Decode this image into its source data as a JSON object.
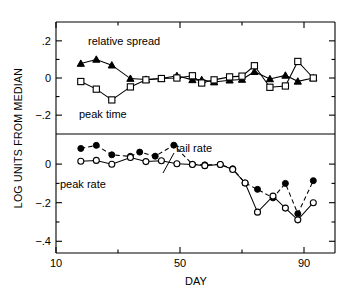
{
  "figure": {
    "title": "",
    "xaxis_title": "DAY",
    "yaxis_title": "LOG UNITS FROM MEDIAN",
    "x_ticklabels": [
      "10",
      "50",
      "90"
    ],
    "upper_ticklabels": [
      ".2",
      "0",
      "−.2"
    ],
    "lower_ticklabels": [
      "0",
      "−.2",
      "−.4"
    ],
    "labels": {
      "relative_spread": "relative spread",
      "peak_time": "peak time",
      "tail_rate": "tail rate",
      "peak_rate": "peak rate"
    }
  },
  "chart_data": [
    {
      "type": "line",
      "panel": "upper",
      "title": "",
      "xlabel": "DAY",
      "ylabel": "LOG UNITS FROM MEDIAN",
      "xlim": [
        10,
        100
      ],
      "ylim": [
        -0.28,
        0.28
      ],
      "xticks": [
        10,
        50,
        90
      ],
      "xticks_minor": [
        30,
        70
      ],
      "yticks": [
        0.2,
        0.0,
        -0.2
      ],
      "yticks_minor": [
        0.1,
        -0.1
      ],
      "grid": false,
      "legend": "inline-annotation",
      "series": [
        {
          "name": "relative spread",
          "marker": "filled-triangle",
          "linestyle": "solid",
          "points": [
            [
              18,
              0.078
            ],
            [
              23,
              0.1
            ],
            [
              28,
              0.069
            ],
            [
              34,
              -0.003
            ],
            [
              39,
              -0.008
            ],
            [
              44,
              -0.003
            ],
            [
              49,
              0.012
            ],
            [
              54,
              -0.01
            ],
            [
              57,
              -0.01
            ],
            [
              61,
              -0.022
            ],
            [
              66,
              -0.012
            ],
            [
              70,
              -0.008
            ],
            [
              74,
              0.034
            ],
            [
              79,
              -0.005
            ],
            [
              84,
              0.014
            ],
            [
              88,
              -0.018
            ],
            [
              93,
              0.0
            ]
          ]
        },
        {
          "name": "peak time",
          "marker": "open-square",
          "linestyle": "solid",
          "points": [
            [
              18,
              -0.019
            ],
            [
              23,
              -0.06
            ],
            [
              28,
              -0.118
            ],
            [
              34,
              -0.048
            ],
            [
              39,
              -0.01
            ],
            [
              44,
              -0.003
            ],
            [
              49,
              0.0
            ],
            [
              54,
              0.012
            ],
            [
              57,
              -0.027
            ],
            [
              61,
              -0.01
            ],
            [
              66,
              0.006
            ],
            [
              70,
              0.01
            ],
            [
              74,
              0.066
            ],
            [
              79,
              -0.05
            ],
            [
              84,
              -0.043
            ],
            [
              88,
              0.089
            ],
            [
              93,
              0.0
            ]
          ]
        }
      ]
    },
    {
      "type": "line",
      "panel": "lower",
      "title": "",
      "xlabel": "DAY",
      "ylabel": "LOG UNITS FROM MEDIAN",
      "xlim": [
        10,
        100
      ],
      "ylim": [
        -0.44,
        0.13
      ],
      "xticks": [
        10,
        50,
        90
      ],
      "xticks_minor": [
        30,
        70
      ],
      "yticks": [
        0.0,
        -0.2,
        -0.4
      ],
      "yticks_minor": [
        -0.1,
        -0.3
      ],
      "grid": false,
      "legend": "inline-annotation",
      "series": [
        {
          "name": "tail rate",
          "marker": "filled-circle",
          "linestyle": "dashed",
          "points": [
            [
              18,
              0.081
            ],
            [
              23,
              0.097
            ],
            [
              28,
              0.048
            ],
            [
              34,
              0.04
            ],
            [
              37,
              0.062
            ],
            [
              42,
              0.041
            ],
            [
              48,
              0.098
            ],
            [
              54,
              -0.001
            ],
            [
              58,
              -0.004
            ],
            [
              63,
              -0.002
            ],
            [
              67,
              -0.024
            ],
            [
              71,
              -0.098
            ],
            [
              75,
              -0.131
            ],
            [
              80,
              -0.175
            ],
            [
              84,
              -0.1
            ],
            [
              88,
              -0.257
            ],
            [
              93,
              -0.086
            ]
          ]
        },
        {
          "name": "peak rate",
          "marker": "open-circle",
          "linestyle": "solid",
          "points": [
            [
              18,
              0.015
            ],
            [
              23,
              0.019
            ],
            [
              28,
              -0.001
            ],
            [
              34,
              0.034
            ],
            [
              39,
              0.013
            ],
            [
              44,
              0.017
            ],
            [
              49,
              0.002
            ],
            [
              54,
              -0.002
            ],
            [
              58,
              -0.008
            ],
            [
              63,
              -0.002
            ],
            [
              67,
              -0.028
            ],
            [
              71,
              -0.098
            ],
            [
              75,
              -0.249
            ],
            [
              80,
              -0.166
            ],
            [
              84,
              -0.228
            ],
            [
              88,
              -0.289
            ],
            [
              93,
              -0.2
            ]
          ]
        }
      ]
    }
  ]
}
